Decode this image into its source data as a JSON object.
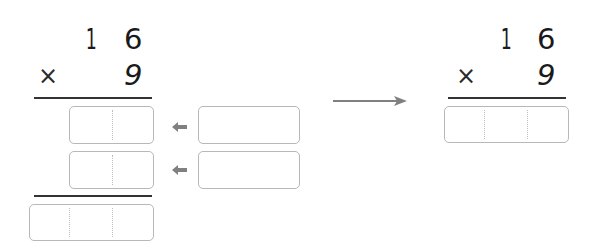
{
  "left_problem": {
    "multiplicand": [
      "1",
      "6"
    ],
    "operator": "×",
    "multiplier": "9",
    "partial_products": [
      {
        "cells": [
          "",
          ""
        ],
        "source_box": ""
      },
      {
        "cells": [
          "",
          ""
        ],
        "source_box": ""
      }
    ],
    "result_cells": [
      "",
      "",
      ""
    ]
  },
  "right_problem": {
    "multiplicand": [
      "1",
      "6"
    ],
    "operator": "×",
    "multiplier": "9",
    "result_cells": [
      "",
      "",
      ""
    ]
  },
  "colors": {
    "digit": "#1a1a1a",
    "rule": "#333333",
    "box_border": "#b8b8b8",
    "arrow": "#808080"
  }
}
